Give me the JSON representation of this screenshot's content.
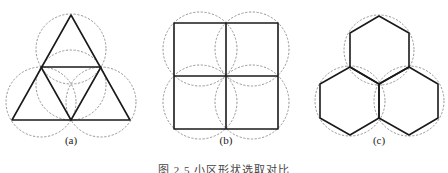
{
  "figure": {
    "panels": [
      {
        "id": "a",
        "label": "(a)",
        "shape": "triangle"
      },
      {
        "id": "b",
        "label": "(b)",
        "shape": "square"
      },
      {
        "id": "c",
        "label": "(c)",
        "shape": "hexagon"
      }
    ],
    "caption": "图 2.5   小区形状选取对比",
    "colors": {
      "line": "#1a1a1a",
      "dashed_circle": "#8a8a8a",
      "background": "#ffffff"
    }
  }
}
